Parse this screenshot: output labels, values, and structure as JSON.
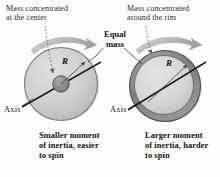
{
  "figure": {
    "type": "physics-diagram",
    "background_color": "#fdfdfd"
  },
  "callouts": {
    "top_left": "Mass concentrated\nat the center",
    "top_right": "Mass concentrated\naround the rim",
    "equal_mass": "Equal\nmass"
  },
  "left_disk": {
    "axis_label": "Axis",
    "radius_label": "R",
    "caption": "Smaller moment\nof inertia, easier\nto spin",
    "body_color": "#cfcfcf",
    "hub_color": "#8f8f8f",
    "edge_color": "#5a5a5a",
    "rotation_arrow": "curved-arrow-right"
  },
  "right_disk": {
    "axis_label": "Axis",
    "radius_label": "R",
    "caption": "Larger moment\nof inertia, harder\nto spin",
    "body_color": "#d6d6d6",
    "rim_color": "#8a8a8a",
    "edge_color": "#4f4f4f",
    "rotation_arrow": "curved-arrow-right"
  },
  "colors": {
    "arrow_gray": "#b3b3b3",
    "leader_line": "#6e6e6e",
    "text": "#1a1a1a"
  }
}
